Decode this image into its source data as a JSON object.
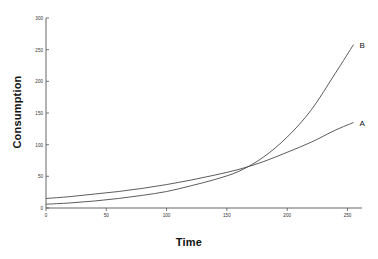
{
  "chart_data": {
    "type": "line",
    "title": "",
    "xlabel": "Time",
    "ylabel": "Consumption",
    "xlim": [
      0,
      262
    ],
    "ylim": [
      0,
      300
    ],
    "xticks": [
      0,
      50,
      100,
      150,
      200,
      250
    ],
    "yticks": [
      0,
      50,
      100,
      150,
      200,
      250,
      300
    ],
    "xticklabels": [
      "0",
      "50",
      "100",
      "150",
      "200",
      "250"
    ],
    "yticklabels": [
      "0",
      "50",
      "100",
      "150",
      "200",
      "250",
      "300"
    ],
    "grid": false,
    "legend_position": "inline-end-labels",
    "annotations": [
      {
        "text": "A",
        "x": 255,
        "y": 135
      },
      {
        "text": "B",
        "x": 255,
        "y": 258
      }
    ],
    "series": [
      {
        "name": "A",
        "label": "A",
        "color": "#4a4a4a",
        "x": [
          0,
          20,
          40,
          60,
          80,
          100,
          120,
          140,
          160,
          180,
          200,
          220,
          240,
          255
        ],
        "values": [
          15,
          18,
          22,
          26,
          31,
          37,
          44,
          52,
          61,
          73,
          88,
          104,
          123,
          135
        ]
      },
      {
        "name": "B",
        "label": "B",
        "color": "#4a4a4a",
        "x": [
          0,
          20,
          40,
          60,
          80,
          100,
          120,
          140,
          160,
          180,
          200,
          220,
          240,
          255
        ],
        "values": [
          6,
          8,
          11,
          15,
          20,
          26,
          35,
          45,
          58,
          80,
          112,
          155,
          213,
          258
        ]
      }
    ],
    "crossing_point": {
      "x": 160,
      "y": 57
    }
  },
  "labels": {
    "xlabel": "Time",
    "ylabel": "Consumption",
    "series_a": "A",
    "series_b": "B",
    "y0": "0",
    "y50": "50",
    "y100": "100",
    "y150": "150",
    "y200": "200",
    "y250": "250",
    "y300": "300",
    "x0": "0",
    "x50": "50",
    "x100": "100",
    "x150": "150",
    "x200": "200",
    "x250": "250"
  },
  "colors": {
    "background": "#ffffff",
    "line": "#4a4a4a",
    "axis": "#555555",
    "text": "#1a1a1a"
  }
}
